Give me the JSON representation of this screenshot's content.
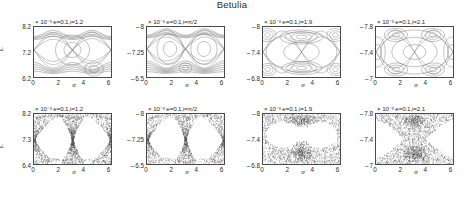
{
  "figure": {
    "title": "Betulia",
    "axis_labels": {
      "x": "σ",
      "y": "L"
    },
    "x_ticks": [
      "0",
      "2",
      "4",
      "6"
    ],
    "x_range": [
      0,
      6.283185
    ],
    "exponent_prefix": "× 10",
    "exponent_value": "-3"
  },
  "panels": [
    {
      "id": "top-1",
      "row": "top",
      "col": 1,
      "title": "× 10⁻³ e=0.1,i=1.2",
      "params": {
        "e": "0.1",
        "i": "1.2"
      },
      "y_ticks": [
        "8.2",
        "7.2",
        "6.2"
      ],
      "y_range": [
        6.2,
        8.2
      ],
      "style": "regular"
    },
    {
      "id": "top-2",
      "row": "top",
      "col": 2,
      "title": "× 10⁻³ e=0.1,i=π/2",
      "params": {
        "e": "0.1",
        "i": "π/2"
      },
      "y_ticks": [
        "8",
        "7.25",
        "6.5"
      ],
      "y_range": [
        6.5,
        8
      ],
      "style": "regular"
    },
    {
      "id": "top-3",
      "row": "top",
      "col": 3,
      "title": "× 10⁻³ e=0.1,i=1.9",
      "params": {
        "e": "0.1",
        "i": "1.9"
      },
      "y_ticks": [
        "8",
        "7.4",
        "6.8"
      ],
      "y_range": [
        6.8,
        8
      ],
      "style": "regular"
    },
    {
      "id": "top-4",
      "row": "top",
      "col": 4,
      "title": "× 10⁻³ e=0.1,i=2.1",
      "params": {
        "e": "0.1",
        "i": "2.1"
      },
      "y_ticks": [
        "7.8",
        "7.4",
        "7"
      ],
      "y_range": [
        7,
        7.8
      ],
      "style": "regular"
    },
    {
      "id": "bottom-1",
      "row": "bottom",
      "col": 1,
      "title": "× 10⁻³ e=0.1,i=1.2",
      "params": {
        "e": "0.1",
        "i": "1.2"
      },
      "y_ticks": [
        "8.2",
        "7.3",
        "6.4"
      ],
      "y_range": [
        6.4,
        8.2
      ],
      "style": "chaotic"
    },
    {
      "id": "bottom-2",
      "row": "bottom",
      "col": 2,
      "title": "× 10⁻³ e=0.1,i=π/2",
      "params": {
        "e": "0.1",
        "i": "π/2"
      },
      "y_ticks": [
        "8",
        "7.25",
        "6.5"
      ],
      "y_range": [
        6.5,
        8
      ],
      "style": "chaotic"
    },
    {
      "id": "bottom-3",
      "row": "bottom",
      "col": 3,
      "title": "× 10⁻³ e=0.1,i=1.9",
      "params": {
        "e": "0.1",
        "i": "1.9"
      },
      "y_ticks": [
        "8",
        "7.4",
        "6.8"
      ],
      "y_range": [
        6.8,
        8
      ],
      "style": "chaotic"
    },
    {
      "id": "bottom-4",
      "row": "bottom",
      "col": 4,
      "title": "× 10⁻³ e=0.1,i=2.1",
      "params": {
        "e": "0.1",
        "i": "2.1"
      },
      "y_ticks": [
        "7.8",
        "7.4",
        "7"
      ],
      "y_range": [
        7,
        7.8
      ],
      "style": "chaotic"
    }
  ],
  "chart_data": {
    "type": "scatter",
    "title": "Betulia",
    "xlabel": "σ",
    "ylabel": "L",
    "grid": false,
    "legend": null,
    "panels": [
      {
        "id": "top-1",
        "x": "sigma",
        "y": "L",
        "xlim": [
          0,
          6.283185
        ],
        "ylim": [
          6.2,
          8.2
        ],
        "xticks": [
          0,
          2,
          4,
          6
        ],
        "yticks": [
          6.2,
          7.2,
          8.2
        ],
        "y_scale": "1e-3",
        "annotations": [
          "e=0.1",
          "i=1.2"
        ],
        "regime": "regular",
        "features": [
          "upper libration band near L=8.05",
          "lower band near L=6.7",
          "two separatrix crossings near sigma=1.6 and sigma=4.7"
        ]
      },
      {
        "id": "top-2",
        "x": "sigma",
        "y": "L",
        "xlim": [
          0,
          6.283185
        ],
        "ylim": [
          6.5,
          8.0
        ],
        "xticks": [
          0,
          2,
          4,
          6
        ],
        "yticks": [
          6.5,
          7.25,
          8.0
        ],
        "y_scale": "1e-3",
        "annotations": [
          "e=0.1",
          "i=pi/2"
        ],
        "regime": "regular",
        "features": [
          "symmetric double separatrix",
          "upper band near L=7.85",
          "lower band near L=6.85"
        ]
      },
      {
        "id": "top-3",
        "x": "sigma",
        "y": "L",
        "xlim": [
          0,
          6.283185
        ],
        "ylim": [
          6.8,
          8.0
        ],
        "xticks": [
          0,
          2,
          4,
          6
        ],
        "yticks": [
          6.8,
          7.4,
          8.0
        ],
        "y_scale": "1e-3",
        "annotations": [
          "e=0.1",
          "i=1.9"
        ],
        "regime": "regular",
        "features": [
          "lens-shaped island centered sigma=3.1 L=7.75",
          "lower island chain near L=7.0"
        ]
      },
      {
        "id": "top-4",
        "x": "sigma",
        "y": "L",
        "xlim": [
          0,
          6.283185
        ],
        "ylim": [
          7.0,
          7.8
        ],
        "xticks": [
          0,
          2,
          4,
          6
        ],
        "yticks": [
          7.0,
          7.4,
          7.8
        ],
        "y_scale": "1e-3",
        "annotations": [
          "e=0.1",
          "i=2.1"
        ],
        "regime": "regular",
        "features": [
          "large central circulation region",
          "corner island chains at all four corners"
        ]
      },
      {
        "id": "bottom-1",
        "x": "sigma",
        "y": "L",
        "xlim": [
          0,
          6.283185
        ],
        "ylim": [
          6.4,
          8.2
        ],
        "xticks": [
          0,
          2,
          4,
          6
        ],
        "yticks": [
          6.4,
          7.3,
          8.2
        ],
        "y_scale": "1e-3",
        "annotations": [
          "e=0.1",
          "i=1.2"
        ],
        "regime": "chaotic",
        "features": [
          "dense hourglass chaotic layer at sigma=3.1",
          "chaotic wedges at sigma=0 and sigma=6.28"
        ]
      },
      {
        "id": "bottom-2",
        "x": "sigma",
        "y": "L",
        "xlim": [
          0,
          6.283185
        ],
        "ylim": [
          6.5,
          8.0
        ],
        "xticks": [
          0,
          2,
          4,
          6
        ],
        "yticks": [
          6.5,
          7.25,
          8.0
        ],
        "y_scale": "1e-3",
        "annotations": [
          "e=0.1",
          "i=pi/2"
        ],
        "regime": "chaotic",
        "features": [
          "narrow hourglass chaotic layer at sigma=3.1",
          "banded chaotic wedges at the edges"
        ]
      },
      {
        "id": "bottom-3",
        "x": "sigma",
        "y": "L",
        "xlim": [
          0,
          6.283185
        ],
        "ylim": [
          6.8,
          8.0
        ],
        "xticks": [
          0,
          2,
          4,
          6
        ],
        "yticks": [
          6.8,
          7.4,
          8.0
        ],
        "y_scale": "1e-3",
        "annotations": [
          "e=0.1",
          "i=1.9"
        ],
        "regime": "chaotic",
        "features": [
          "broad speckled chaotic sea surrounding two empty regular islands",
          "chaotic plume rising at sigma=3.1"
        ]
      },
      {
        "id": "bottom-4",
        "x": "sigma",
        "y": "L",
        "xlim": [
          0,
          6.283185
        ],
        "ylim": [
          7.0,
          7.8
        ],
        "xticks": [
          0,
          2,
          4,
          6
        ],
        "yticks": [
          7.0,
          7.4,
          7.8
        ],
        "y_scale": "1e-3",
        "annotations": [
          "e=0.1",
          "i=2.1"
        ],
        "regime": "chaotic",
        "features": [
          "chaotic sea filling top and bottom",
          "large empty regular core in the middle"
        ]
      }
    ]
  }
}
